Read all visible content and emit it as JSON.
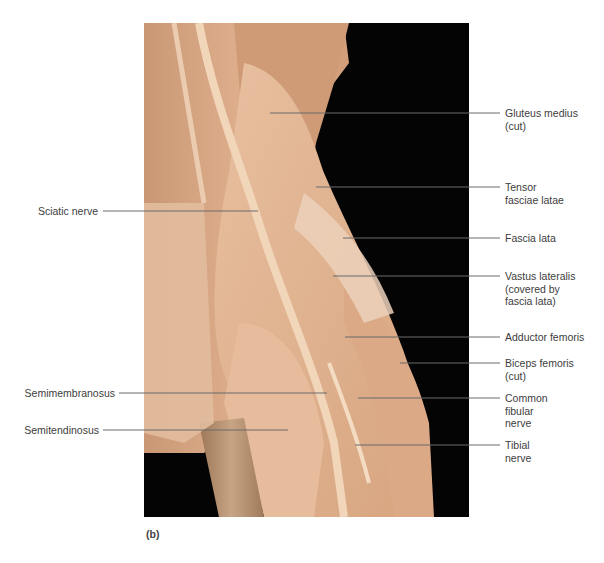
{
  "figure": {
    "panel_letter": "(b)",
    "colors": {
      "background": "#050404",
      "muscle_tan": "#d9a47e",
      "fascia_pale": "#e6c2a6",
      "nerve": "#f0d2b4",
      "fur": "#b08a68",
      "leader_line": "#6b6b6b",
      "label_text": "#3d3d3d"
    }
  },
  "labels_right": [
    {
      "id": "gluteus-medius",
      "text": "Gluteus medius\n(cut)"
    },
    {
      "id": "tensor-fasciae-latae",
      "text": "Tensor\nfasciae latae"
    },
    {
      "id": "fascia-lata",
      "text": "Fascia lata"
    },
    {
      "id": "vastus-lateralis",
      "text": "Vastus lateralis\n(covered by\nfascia lata)"
    },
    {
      "id": "adductor-femoris",
      "text": "Adductor femoris"
    },
    {
      "id": "biceps-femoris",
      "text": "Biceps femoris\n(cut)"
    },
    {
      "id": "common-fibular-nerve",
      "text": "Common\nfibular\nnerve"
    },
    {
      "id": "tibial-nerve",
      "text": "Tibial\nnerve"
    }
  ],
  "labels_left": [
    {
      "id": "sciatic-nerve",
      "text": "Sciatic nerve"
    },
    {
      "id": "semimembranosus",
      "text": "Semimembranosus"
    },
    {
      "id": "semitendinosus",
      "text": "Semitendinosus"
    }
  ]
}
